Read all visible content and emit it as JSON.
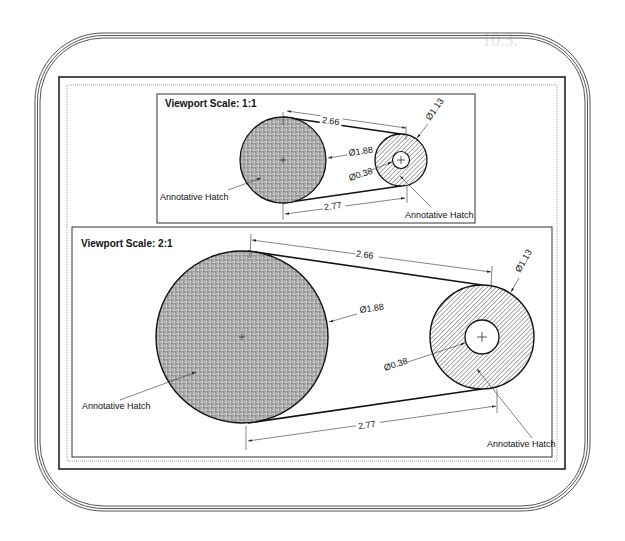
{
  "background": {
    "heading": "10.3.",
    "line": "The ... command is discussed in ..."
  },
  "viewports": [
    {
      "title": "Viewport Scale: 1:1",
      "large_circle": {
        "diameter_label": "Ø1.88",
        "hatch_label": "Annotative Hatch"
      },
      "small_circle": {
        "diameter_label": "Ø1.13",
        "hole_label": "Ø0.38",
        "hatch_label": "Annotative Hatch"
      },
      "top_distance": "2.66",
      "bottom_distance": "2.77"
    },
    {
      "title": "Viewport Scale: 2:1",
      "large_circle": {
        "diameter_label": "Ø1.88",
        "hatch_label": "Annotative Hatch"
      },
      "small_circle": {
        "diameter_label": "Ø1.13",
        "hole_label": "Ø0.38",
        "hatch_label": "Annotative Hatch"
      },
      "top_distance": "2.66",
      "bottom_distance": "2.77"
    }
  ],
  "colors": {
    "line": "#1a1a1a",
    "frame": "#555555",
    "hatch_fill": "#9a9a9a"
  }
}
